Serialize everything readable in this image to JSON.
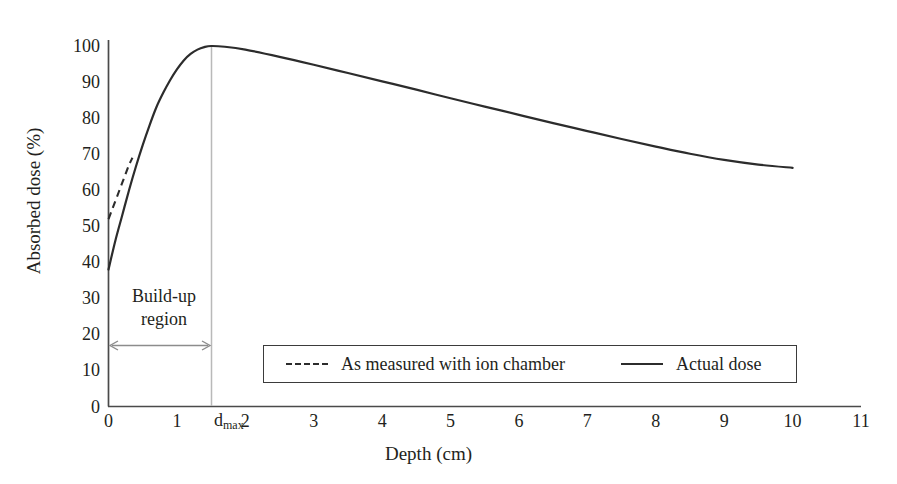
{
  "chart_data": {
    "type": "line",
    "title": "",
    "xlabel": "Depth (cm)",
    "ylabel": "Absorbed dose (%)",
    "xlim": [
      0,
      11
    ],
    "ylim": [
      0,
      100
    ],
    "xticks": [
      0,
      1,
      2,
      3,
      4,
      5,
      6,
      7,
      8,
      9,
      10,
      11
    ],
    "yticks": [
      0,
      10,
      20,
      30,
      40,
      50,
      60,
      70,
      80,
      90,
      100
    ],
    "grid": false,
    "legend_position": "inside-lower-center",
    "series": [
      {
        "name": "Actual dose",
        "style": "solid",
        "color": "#2c2c2c",
        "x": [
          0,
          0.1,
          0.2,
          0.3,
          0.4,
          0.5,
          0.6,
          0.7,
          0.8,
          0.9,
          1.0,
          1.1,
          1.2,
          1.3,
          1.4,
          1.5,
          1.7,
          2.0,
          2.5,
          3.0,
          3.5,
          4.0,
          4.5,
          5.0,
          5.5,
          6.0,
          6.5,
          7.0,
          7.5,
          8.0,
          8.5,
          9.0,
          9.5,
          10.0
        ],
        "y": [
          38,
          46,
          53,
          60,
          66.5,
          72.5,
          78,
          83,
          87,
          90.5,
          93.5,
          96,
          97.8,
          99,
          99.7,
          100,
          99.8,
          99,
          97,
          94.8,
          92.5,
          90.2,
          87.9,
          85.5,
          83.2,
          80.9,
          78.6,
          76.4,
          74.2,
          72.1,
          70.1,
          68.4,
          67.1,
          66.2
        ]
      },
      {
        "name": "As measured with ion chamber",
        "style": "dashed",
        "color": "#2c2c2c",
        "x": [
          0,
          0.05,
          0.1,
          0.15,
          0.2,
          0.25,
          0.3,
          0.35
        ],
        "y": [
          52,
          54.5,
          57,
          59.5,
          62,
          64.5,
          67,
          69
        ]
      }
    ],
    "annotations": [
      {
        "name": "build-up-region",
        "text_line1": "Build-up",
        "text_line2": "region",
        "arrow_from_x": 0,
        "arrow_to_x": 1.5,
        "arrow_y": 16,
        "arrow_style": "double-headed",
        "color": "#8c8c8c"
      },
      {
        "name": "dmax-marker",
        "text": "d",
        "subscript": "max",
        "x": 1.5,
        "style": "vertical-line",
        "color": "#b5b5b5"
      }
    ],
    "legend_entries": [
      {
        "label": "As measured with ion chamber",
        "style": "dashed"
      },
      {
        "label": "Actual dose",
        "style": "solid"
      }
    ]
  },
  "axis": {
    "y_label": "Absorbed dose (%)",
    "x_label": "Depth (cm)",
    "y_tick_labels": [
      "100",
      "90",
      "80",
      "70",
      "60",
      "50",
      "40",
      "30",
      "20",
      "10",
      "0"
    ],
    "x_tick_labels": [
      "0",
      "1",
      "2",
      "3",
      "4",
      "5",
      "6",
      "7",
      "8",
      "9",
      "10",
      "11"
    ]
  },
  "annotation": {
    "buildup_line1": "Build-up",
    "buildup_line2": "region",
    "dmax_main": "d",
    "dmax_sub": "max"
  },
  "legend": {
    "dashed_label": "As measured with ion chamber",
    "solid_label": "Actual dose"
  },
  "colors": {
    "curve": "#2c2c2c",
    "axis": "#4a4a4a",
    "annotation": "#8c8c8c",
    "dmax_line": "#b5b5b5",
    "text": "#231f20",
    "background": "#ffffff"
  }
}
